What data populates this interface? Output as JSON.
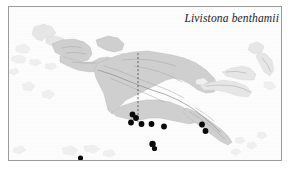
{
  "figure": {
    "type": "distribution-map",
    "caption": "Livistona benthamii",
    "region": "New Guinea and adjacent islands",
    "frame": {
      "border_color": "#9a9a9a",
      "background": "#fdfdfd"
    },
    "colors": {
      "land": "#cfcfcf",
      "land_faint": "#e6e6e6",
      "land_pale": "#efefef",
      "relief": "#8e8e8e",
      "occurrence_dot": "#0a0a0a",
      "border_line": "#3a3a3a",
      "caption_text": "#1b1b1b"
    },
    "legend_items": [],
    "scale_bar": null,
    "axis_labels": []
  },
  "map_features": {
    "political_border": {
      "name": "Indonesia / Papua New Guinea border",
      "style": "dashed vertical line"
    },
    "occurrence_points_count": 11
  },
  "chart_data": {
    "type": "scatter",
    "title": "Livistona benthamii",
    "xlabel": "",
    "ylabel": "",
    "series": [
      {
        "name": "occurrence records",
        "marker": "filled-circle",
        "points": [
          {
            "id": "p1",
            "x": 132.5,
            "y": 114.5,
            "r": 2.9
          },
          {
            "id": "p2",
            "x": 136.0,
            "y": 118.0,
            "r": 2.9
          },
          {
            "id": "p3",
            "x": 131.0,
            "y": 122.5,
            "r": 2.9
          },
          {
            "id": "p4",
            "x": 141.5,
            "y": 124.0,
            "r": 2.9
          },
          {
            "id": "p5",
            "x": 151.5,
            "y": 124.0,
            "r": 2.9
          },
          {
            "id": "p6",
            "x": 164.0,
            "y": 126.5,
            "r": 2.9
          },
          {
            "id": "p7",
            "x": 202.0,
            "y": 124.5,
            "r": 2.9
          },
          {
            "id": "p8",
            "x": 205.5,
            "y": 131.0,
            "r": 2.9
          },
          {
            "id": "p9",
            "x": 152.5,
            "y": 144.0,
            "r": 3.2
          },
          {
            "id": "p10",
            "x": 154.5,
            "y": 148.5,
            "r": 2.6
          },
          {
            "id": "p11",
            "x": 80.5,
            "y": 158.0,
            "r": 2.6
          }
        ]
      }
    ],
    "xlim": [
      8,
      282
    ],
    "ylim": [
      6,
      161
    ],
    "grid": false,
    "legend": "none"
  }
}
